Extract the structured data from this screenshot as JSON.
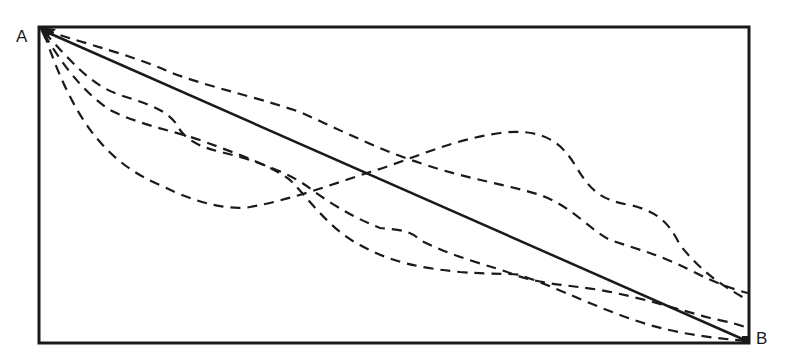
{
  "diagram": {
    "type": "path-comparison",
    "points": {
      "start": {
        "label": "A",
        "x": 42,
        "y": 30
      },
      "end": {
        "label": "B",
        "x": 747,
        "y": 341
      }
    },
    "frame": {
      "x": 39,
      "y": 27,
      "width": 710,
      "height": 316
    },
    "colors": {
      "ink": "#1a1a1a",
      "background": "#ffffff"
    },
    "paths": [
      {
        "name": "straight-path",
        "style": "solid",
        "description": "Straight line from A to B"
      },
      {
        "name": "upper-dashed-path",
        "style": "dashed",
        "description": "Wavy path above the straight line, ends on right edge near y=293"
      },
      {
        "name": "middle-dashed-path",
        "style": "dashed",
        "description": "Wavy path starting below, crossing above the straight line, ends on right edge near y=320"
      },
      {
        "name": "low-loop-dashed-path",
        "style": "dashed",
        "description": "Path dipping low then rising above the straight line before descending to right edge"
      },
      {
        "name": "bottom-dashed-path",
        "style": "dashed",
        "description": "Path descending steeply, crossing, then running along the bottom to B"
      }
    ]
  }
}
